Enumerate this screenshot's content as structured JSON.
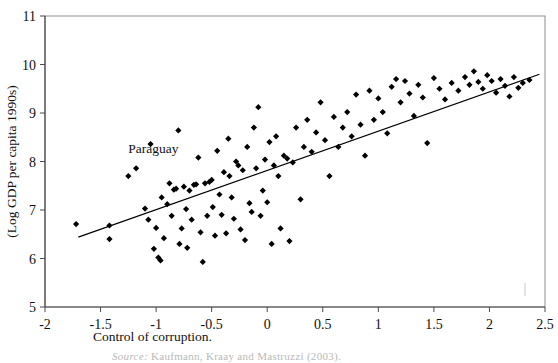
{
  "figure": {
    "annotation": {
      "text": "Paraguay",
      "x": -1.25,
      "y": 8.18
    },
    "source_note": {
      "prefix": "Source:",
      "text": "Kaufmann, Kraay and Mastruzzi (2003)."
    }
  },
  "chart_data": {
    "type": "scatter",
    "title": "",
    "xlabel": "Control of corruption.",
    "ylabel": "(Log GDP per capita 1990s)",
    "xlim": [
      -2,
      2.5
    ],
    "ylim": [
      5,
      11
    ],
    "xticks": [
      -2,
      -1.5,
      -1,
      -0.5,
      0,
      0.5,
      1,
      1.5,
      2,
      2.5
    ],
    "xtick_labels": [
      "-2",
      "-1.5",
      "-1",
      "-0.5",
      "0",
      "0.5",
      "1",
      "1.5",
      "2",
      "2.5"
    ],
    "yticks": [
      5,
      6,
      7,
      8,
      9,
      10,
      11
    ],
    "ytick_labels": [
      "5",
      "6",
      "7",
      "8",
      "9",
      "10",
      "11"
    ],
    "grid": false,
    "legend": false,
    "marker": "diamond",
    "marker_color": "#000000",
    "trendline": {
      "label": "linear fit",
      "color": "#000000",
      "x0": -1.7,
      "y0": 6.44,
      "x1": 2.45,
      "y1": 9.8
    },
    "points": [
      [
        -1.72,
        6.71
      ],
      [
        -1.42,
        6.68
      ],
      [
        -1.42,
        6.4
      ],
      [
        -1.25,
        7.7
      ],
      [
        -1.18,
        7.86
      ],
      [
        -1.1,
        7.03
      ],
      [
        -1.07,
        6.8
      ],
      [
        -1.05,
        8.36
      ],
      [
        -1.02,
        6.2
      ],
      [
        -1.0,
        6.63
      ],
      [
        -0.98,
        6.02
      ],
      [
        -0.96,
        5.96
      ],
      [
        -0.95,
        7.26
      ],
      [
        -0.93,
        6.42
      ],
      [
        -0.9,
        7.12
      ],
      [
        -0.88,
        7.55
      ],
      [
        -0.86,
        6.88
      ],
      [
        -0.84,
        7.42
      ],
      [
        -0.82,
        7.44
      ],
      [
        -0.8,
        8.64
      ],
      [
        -0.79,
        6.3
      ],
      [
        -0.77,
        6.62
      ],
      [
        -0.75,
        7.48
      ],
      [
        -0.73,
        7.02
      ],
      [
        -0.72,
        6.22
      ],
      [
        -0.7,
        7.4
      ],
      [
        -0.68,
        6.8
      ],
      [
        -0.66,
        7.52
      ],
      [
        -0.64,
        7.53
      ],
      [
        -0.62,
        8.08
      ],
      [
        -0.6,
        6.54
      ],
      [
        -0.58,
        5.93
      ],
      [
        -0.56,
        7.55
      ],
      [
        -0.54,
        6.88
      ],
      [
        -0.52,
        7.58
      ],
      [
        -0.5,
        7.62
      ],
      [
        -0.49,
        7.06
      ],
      [
        -0.47,
        6.47
      ],
      [
        -0.45,
        8.22
      ],
      [
        -0.43,
        7.32
      ],
      [
        -0.41,
        6.9
      ],
      [
        -0.39,
        7.78
      ],
      [
        -0.37,
        6.52
      ],
      [
        -0.35,
        8.47
      ],
      [
        -0.34,
        7.7
      ],
      [
        -0.32,
        7.26
      ],
      [
        -0.3,
        6.82
      ],
      [
        -0.28,
        8.0
      ],
      [
        -0.26,
        7.92
      ],
      [
        -0.24,
        6.6
      ],
      [
        -0.22,
        7.82
      ],
      [
        -0.2,
        6.38
      ],
      [
        -0.18,
        8.3
      ],
      [
        -0.16,
        7.14
      ],
      [
        -0.14,
        6.96
      ],
      [
        -0.12,
        8.7
      ],
      [
        -0.1,
        7.86
      ],
      [
        -0.08,
        9.12
      ],
      [
        -0.06,
        6.88
      ],
      [
        -0.04,
        7.4
      ],
      [
        -0.02,
        8.04
      ],
      [
        0.0,
        7.16
      ],
      [
        0.02,
        8.4
      ],
      [
        0.04,
        6.3
      ],
      [
        0.06,
        7.92
      ],
      [
        0.08,
        8.52
      ],
      [
        0.1,
        7.7
      ],
      [
        0.12,
        6.62
      ],
      [
        0.15,
        8.12
      ],
      [
        0.18,
        8.06
      ],
      [
        0.2,
        6.36
      ],
      [
        0.23,
        7.98
      ],
      [
        0.26,
        8.7
      ],
      [
        0.3,
        7.22
      ],
      [
        0.33,
        8.3
      ],
      [
        0.36,
        8.86
      ],
      [
        0.4,
        8.2
      ],
      [
        0.44,
        8.6
      ],
      [
        0.48,
        9.22
      ],
      [
        0.52,
        8.44
      ],
      [
        0.56,
        7.7
      ],
      [
        0.6,
        8.92
      ],
      [
        0.64,
        8.3
      ],
      [
        0.68,
        8.7
      ],
      [
        0.72,
        9.02
      ],
      [
        0.76,
        8.52
      ],
      [
        0.8,
        9.38
      ],
      [
        0.84,
        8.76
      ],
      [
        0.88,
        8.12
      ],
      [
        0.92,
        9.46
      ],
      [
        0.96,
        8.86
      ],
      [
        1.0,
        9.3
      ],
      [
        1.04,
        9.02
      ],
      [
        1.08,
        8.58
      ],
      [
        1.12,
        9.54
      ],
      [
        1.16,
        9.7
      ],
      [
        1.2,
        9.22
      ],
      [
        1.24,
        9.66
      ],
      [
        1.28,
        9.4
      ],
      [
        1.32,
        8.94
      ],
      [
        1.36,
        9.58
      ],
      [
        1.4,
        9.32
      ],
      [
        1.44,
        8.38
      ],
      [
        1.5,
        9.72
      ],
      [
        1.55,
        9.5
      ],
      [
        1.6,
        9.28
      ],
      [
        1.66,
        9.62
      ],
      [
        1.72,
        9.46
      ],
      [
        1.78,
        9.74
      ],
      [
        1.82,
        9.58
      ],
      [
        1.86,
        9.86
      ],
      [
        1.9,
        9.64
      ],
      [
        1.94,
        9.5
      ],
      [
        1.98,
        9.78
      ],
      [
        2.02,
        9.66
      ],
      [
        2.06,
        9.42
      ],
      [
        2.1,
        9.7
      ],
      [
        2.14,
        9.56
      ],
      [
        2.18,
        9.34
      ],
      [
        2.22,
        9.74
      ],
      [
        2.26,
        9.52
      ],
      [
        2.3,
        9.62
      ],
      [
        2.36,
        9.68
      ]
    ]
  }
}
